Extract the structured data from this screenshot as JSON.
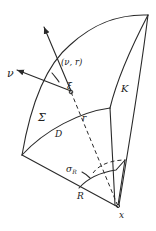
{
  "diagram": {
    "type": "geometric-figure",
    "stroke_color": "#2a2a2a",
    "labels": {
      "nu": "ν",
      "nu_r": "(ν, r)",
      "xi": "ξ",
      "sigma": "Σ",
      "D": "D",
      "r": "r",
      "K": "K",
      "sigma_R": "σ",
      "sigma_R_sub": "R",
      "R": "R",
      "x": "x"
    }
  }
}
